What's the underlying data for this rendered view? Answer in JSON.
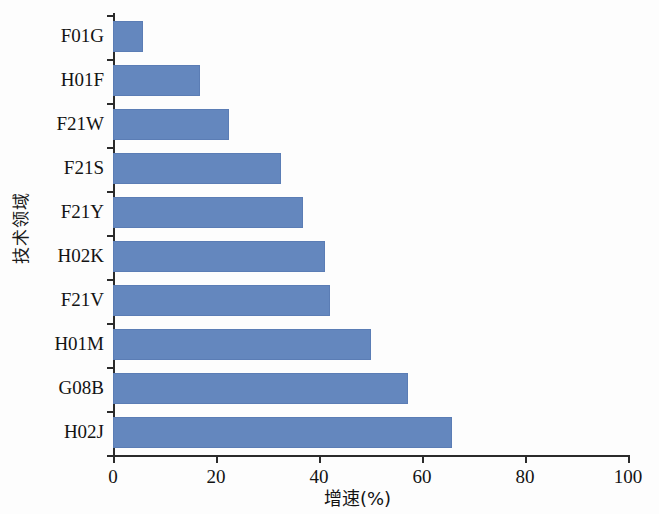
{
  "chart_data": {
    "type": "bar",
    "orientation": "horizontal",
    "title": "",
    "xlabel": "增速(%)",
    "ylabel": "技术领域",
    "xlim": [
      0,
      100
    ],
    "xticks": [
      0,
      20,
      40,
      60,
      80,
      100
    ],
    "xtick_labels": [
      "0",
      "20",
      "40",
      "60",
      "80",
      "100"
    ],
    "grid": false,
    "legend": null,
    "series_color": "#6487be",
    "categories": [
      "F01G",
      "H01F",
      "F21W",
      "F21S",
      "F21Y",
      "H02K",
      "F21V",
      "H01M",
      "G08B",
      "H02J"
    ],
    "values": [
      5.8,
      16.9,
      22.5,
      32.6,
      36.9,
      41.2,
      42.1,
      50.1,
      57.3,
      65.8
    ],
    "bars": [
      {
        "category": "F01G",
        "value": 5.8
      },
      {
        "category": "H01F",
        "value": 16.9
      },
      {
        "category": "F21W",
        "value": 22.5
      },
      {
        "category": "F21S",
        "value": 32.6
      },
      {
        "category": "F21Y",
        "value": 36.9
      },
      {
        "category": "H02K",
        "value": 41.2
      },
      {
        "category": "F21V",
        "value": 42.1
      },
      {
        "category": "H01M",
        "value": 50.1
      },
      {
        "category": "G08B",
        "value": 57.3
      },
      {
        "category": "H02J",
        "value": 65.8
      }
    ]
  }
}
